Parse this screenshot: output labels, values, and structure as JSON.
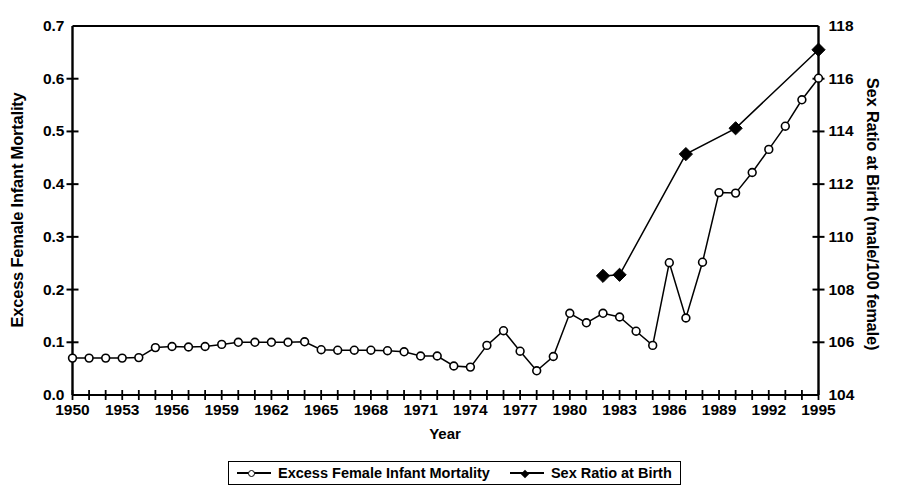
{
  "axes": {
    "xlabel": "Year",
    "ylabel_left": "Excess Female Infant Mortality",
    "ylabel_right": "Sex Ratio at Birth (male/100 female)",
    "ytick_labels_left": [
      "0.0",
      "0.1",
      "0.2",
      "0.3",
      "0.4",
      "0.5",
      "0.6",
      "0.7"
    ],
    "ytick_labels_right": [
      "104",
      "106",
      "108",
      "110",
      "112",
      "114",
      "116",
      "118"
    ],
    "xtick_labels": [
      "1950",
      "1953",
      "1956",
      "1959",
      "1962",
      "1965",
      "1968",
      "1971",
      "1974",
      "1977",
      "1980",
      "1983",
      "1986",
      "1989",
      "1992",
      "1995"
    ]
  },
  "legend": {
    "entries": [
      {
        "label": "Excess Female Infant Mortality",
        "marker": "open-circle-icon",
        "color": "#000000"
      },
      {
        "label": "Sex Ratio at Birth",
        "marker": "filled-diamond-icon",
        "color": "#000000"
      }
    ]
  },
  "chart_data": {
    "type": "line",
    "title": "",
    "subtitle": "",
    "xlabel": "Year",
    "ylabel": "Excess Female Infant Mortality",
    "ylabel_secondary": "Sex Ratio at Birth (male/100 female)",
    "xlim": [
      1950,
      1995
    ],
    "ylim": [
      0.0,
      0.7
    ],
    "ylim_secondary": [
      104,
      118
    ],
    "grid": false,
    "legend_position": "below",
    "series": [
      {
        "name": "Excess Female Infant Mortality",
        "axis": "left",
        "marker": "open-circle",
        "x": [
          1950,
          1951,
          1952,
          1953,
          1954,
          1955,
          1956,
          1957,
          1958,
          1959,
          1960,
          1961,
          1962,
          1963,
          1964,
          1965,
          1966,
          1967,
          1968,
          1969,
          1970,
          1971,
          1972,
          1973,
          1974,
          1975,
          1976,
          1977,
          1978,
          1979,
          1980,
          1981,
          1982,
          1983,
          1984,
          1985,
          1986,
          1987,
          1988,
          1989,
          1990,
          1991,
          1992,
          1993,
          1994,
          1995
        ],
        "y": [
          0.07,
          0.07,
          0.07,
          0.07,
          0.071,
          0.09,
          0.092,
          0.091,
          0.092,
          0.096,
          0.1,
          0.1,
          0.1,
          0.1,
          0.101,
          0.086,
          0.085,
          0.085,
          0.085,
          0.084,
          0.082,
          0.074,
          0.074,
          0.055,
          0.053,
          0.094,
          0.122,
          0.083,
          0.046,
          0.073,
          0.155,
          0.137,
          0.155,
          0.148,
          0.121,
          0.094,
          0.251,
          0.146,
          0.252,
          0.384,
          0.383,
          0.422,
          0.466,
          0.51,
          0.56,
          0.601
        ]
      },
      {
        "name": "Sex Ratio at Birth",
        "axis": "right",
        "marker": "filled-diamond",
        "x": [
          1982,
          1983,
          1987,
          1990,
          1995
        ],
        "y_left_equivalent": [
          0.226,
          0.228,
          0.457,
          0.506,
          0.655
        ],
        "y": [
          108.5,
          108.6,
          113.1,
          114.1,
          117.1
        ]
      }
    ]
  }
}
